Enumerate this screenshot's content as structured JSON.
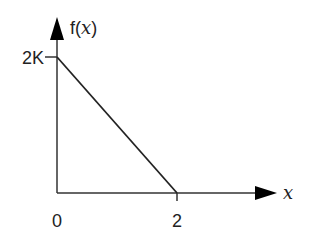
{
  "chart_data": {
    "type": "line",
    "title": "",
    "xlabel": "x",
    "ylabel": "f(x)",
    "ylabel_parts": {
      "prefix": "f(",
      "var": "x",
      "suffix": ")"
    },
    "x_ticks": [
      {
        "value": 0,
        "label": "0"
      },
      {
        "value": 2,
        "label": "2"
      }
    ],
    "y_ticks": [
      {
        "value": 2,
        "label": "2K"
      }
    ],
    "xlim": [
      0,
      2.7
    ],
    "ylim": [
      0,
      2.4
    ],
    "grid": false,
    "series": [
      {
        "name": "f(x)",
        "x": [
          0,
          2
        ],
        "y": [
          2,
          0
        ],
        "color": "#222222"
      }
    ]
  }
}
